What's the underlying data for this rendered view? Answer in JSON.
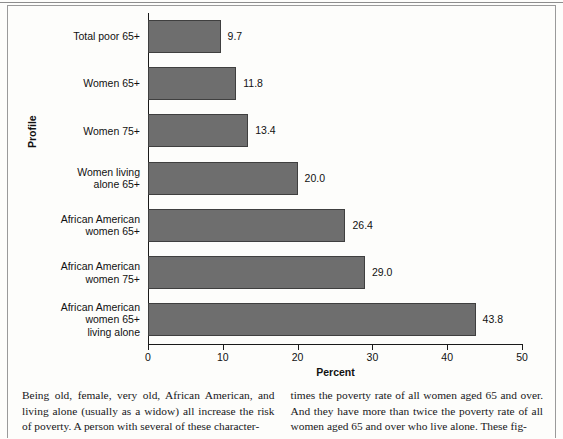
{
  "chart_data": {
    "type": "bar",
    "orientation": "horizontal",
    "title": "",
    "xlabel": "Percent",
    "ylabel": "Profile",
    "xlim": [
      0,
      50
    ],
    "xticks": [
      0,
      10,
      20,
      30,
      40,
      50
    ],
    "grid": false,
    "legend": null,
    "bar_color": "#6e6e6e",
    "categories": [
      "Total poor 65+",
      "Women 65+",
      "Women 75+",
      "Women living\nalone 65+",
      "African American\nwomen 65+",
      "African American\nwomen 75+",
      "African American\nwomen 65+\nliving alone"
    ],
    "values": [
      9.7,
      11.8,
      13.4,
      20.0,
      26.4,
      29.0,
      43.8
    ],
    "value_labels": [
      "9.7",
      "11.8",
      "13.4",
      "20.0",
      "26.4",
      "29.0",
      "43.8"
    ],
    "tick_labels": [
      "0",
      "10",
      "20",
      "30",
      "40",
      "50"
    ]
  },
  "body_text": {
    "left_column": "Being old, female, very old, African American, and living alone (usually as a widow) all increase the risk of poverty. A person with several of these character-",
    "right_column": "times the poverty rate of all women aged 65 and over. And they have more than twice the poverty rate of all women aged 65 and over who live alone. These fig-"
  }
}
